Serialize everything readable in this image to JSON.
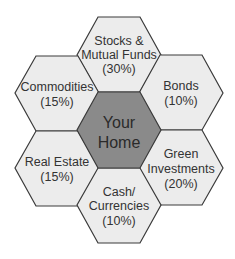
{
  "diagram": {
    "colors": {
      "background": "#ffffff",
      "outer_fill": "#ececec",
      "center_fill": "#8a8a8a",
      "stroke": "#3a3a3a",
      "text": "#333333"
    },
    "center": {
      "lines": [
        "Your",
        "Home"
      ]
    },
    "cells": [
      {
        "id": "stocks",
        "position": "top",
        "lines": [
          "Stocks &",
          "Mutual Funds",
          "(30%)"
        ],
        "name": "Stocks & Mutual Funds",
        "percent": 30
      },
      {
        "id": "bonds",
        "position": "top-right",
        "lines": [
          "Bonds",
          "(10%)"
        ],
        "name": "Bonds",
        "percent": 10
      },
      {
        "id": "green",
        "position": "bottom-right",
        "lines": [
          "Green",
          "Investments",
          "(20%)"
        ],
        "name": "Green Investments",
        "percent": 20
      },
      {
        "id": "cash",
        "position": "bottom",
        "lines": [
          "Cash/",
          "Currencies",
          "(10%)"
        ],
        "name": "Cash/Currencies",
        "percent": 10
      },
      {
        "id": "realestate",
        "position": "bottom-left",
        "lines": [
          "Real Estate",
          "(15%)"
        ],
        "name": "Real Estate",
        "percent": 15
      },
      {
        "id": "commodities",
        "position": "top-left",
        "lines": [
          "Commodities",
          "(15%)"
        ],
        "name": "Commodities",
        "percent": 15
      }
    ]
  }
}
